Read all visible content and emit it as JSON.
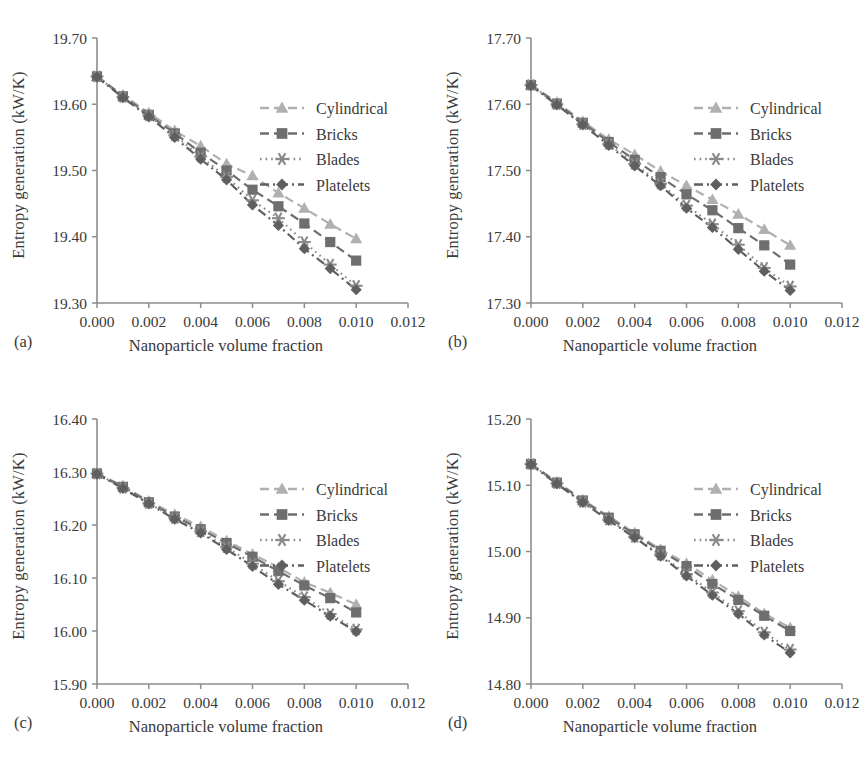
{
  "figure": {
    "panels": [
      "a",
      "b",
      "c",
      "d"
    ],
    "panel_tags": {
      "a": "(a)",
      "b": "(b)",
      "c": "(c)",
      "d": "(d)"
    },
    "axis_label_x": "Nanoparticle volume fraction",
    "axis_label_y": "Entropy generation (kW/K)",
    "colors": {
      "cylindrical": "#b0b0b0",
      "bricks": "#6e6e6e",
      "blades": "#8a8a8a",
      "platelets": "#5f5f5f",
      "axis": "#8d8d8d",
      "text": "#3a3a3a",
      "background": "#ffffff"
    }
  },
  "chart_data": [
    {
      "type": "line",
      "panel": "a",
      "title": "(a)",
      "xlabel": "Nanoparticle volume fraction",
      "ylabel": "Entropy generation (kW/K)",
      "xlim": [
        0.0,
        0.012
      ],
      "ylim": [
        19.3,
        19.7
      ],
      "xticks": [
        0.0,
        0.002,
        0.004,
        0.006,
        0.008,
        0.01,
        0.012
      ],
      "xticklabels": [
        "0.000",
        "0.002",
        "0.004",
        "0.006",
        "0.008",
        "0.010",
        "0.012"
      ],
      "yticks": [
        19.3,
        19.4,
        19.5,
        19.6,
        19.7
      ],
      "yticklabels": [
        "19.30",
        "19.40",
        "19.50",
        "19.60",
        "19.70"
      ],
      "grid": false,
      "legend_position": "upper right",
      "x": [
        0.0,
        0.001,
        0.002,
        0.003,
        0.004,
        0.005,
        0.006,
        0.007,
        0.008,
        0.009,
        0.01
      ],
      "series": [
        {
          "name": "Cylindrical",
          "marker": "triangle",
          "dash": "dashed",
          "values": [
            19.642,
            19.614,
            19.587,
            19.56,
            19.537,
            19.51,
            19.492,
            19.466,
            19.443,
            19.419,
            19.397
          ]
        },
        {
          "name": "Bricks",
          "marker": "square",
          "dash": "dashed",
          "values": [
            19.642,
            19.612,
            19.584,
            19.556,
            19.527,
            19.5,
            19.471,
            19.446,
            19.42,
            19.392,
            19.364
          ]
        },
        {
          "name": "Blades",
          "marker": "asterisk",
          "dash": "dotted",
          "values": [
            19.642,
            19.611,
            19.583,
            19.553,
            19.521,
            19.49,
            19.455,
            19.428,
            19.392,
            19.358,
            19.326
          ]
        },
        {
          "name": "Platelets",
          "marker": "diamond",
          "dash": "dashdot",
          "values": [
            19.641,
            19.61,
            19.581,
            19.55,
            19.517,
            19.486,
            19.448,
            19.417,
            19.382,
            19.352,
            19.32
          ]
        }
      ]
    },
    {
      "type": "line",
      "panel": "b",
      "title": "(b)",
      "xlabel": "Nanoparticle volume fraction",
      "ylabel": "Entropy generation (kW/K)",
      "xlim": [
        0.0,
        0.012
      ],
      "ylim": [
        17.3,
        17.7
      ],
      "xticks": [
        0.0,
        0.002,
        0.004,
        0.006,
        0.008,
        0.01,
        0.012
      ],
      "xticklabels": [
        "0.000",
        "0.002",
        "0.004",
        "0.006",
        "0.008",
        "0.010",
        "0.012"
      ],
      "yticks": [
        17.3,
        17.4,
        17.5,
        17.6,
        17.7
      ],
      "yticklabels": [
        "17.30",
        "17.40",
        "17.50",
        "17.60",
        "17.70"
      ],
      "grid": false,
      "legend_position": "upper right",
      "x": [
        0.0,
        0.001,
        0.002,
        0.003,
        0.004,
        0.005,
        0.006,
        0.007,
        0.008,
        0.009,
        0.01
      ],
      "series": [
        {
          "name": "Cylindrical",
          "marker": "triangle",
          "dash": "dashed",
          "values": [
            17.629,
            17.603,
            17.574,
            17.547,
            17.524,
            17.499,
            17.477,
            17.456,
            17.434,
            17.411,
            17.387
          ]
        },
        {
          "name": "Bricks",
          "marker": "square",
          "dash": "dashed",
          "values": [
            17.629,
            17.601,
            17.572,
            17.543,
            17.516,
            17.49,
            17.464,
            17.44,
            17.413,
            17.387,
            17.358
          ]
        },
        {
          "name": "Blades",
          "marker": "asterisk",
          "dash": "dotted",
          "values": [
            17.629,
            17.6,
            17.57,
            17.54,
            17.51,
            17.48,
            17.447,
            17.419,
            17.388,
            17.353,
            17.325
          ]
        },
        {
          "name": "Platelets",
          "marker": "diamond",
          "dash": "dashdot",
          "values": [
            17.628,
            17.599,
            17.569,
            17.538,
            17.507,
            17.477,
            17.443,
            17.414,
            17.381,
            17.348,
            17.319
          ]
        }
      ]
    },
    {
      "type": "line",
      "panel": "c",
      "title": "(c)",
      "xlabel": "Nanoparticle volume fraction",
      "ylabel": "Entropy generation (kW/K)",
      "xlim": [
        0.0,
        0.012
      ],
      "ylim": [
        15.9,
        16.4
      ],
      "xticks": [
        0.0,
        0.002,
        0.004,
        0.006,
        0.008,
        0.01,
        0.012
      ],
      "xticklabels": [
        "0.000",
        "0.002",
        "0.004",
        "0.006",
        "0.008",
        "0.010",
        "0.012"
      ],
      "yticks": [
        15.9,
        16.0,
        16.1,
        16.2,
        16.3,
        16.4
      ],
      "yticklabels": [
        "15.90",
        "16.00",
        "16.10",
        "16.20",
        "16.30",
        "16.40"
      ],
      "grid": false,
      "legend_position": "upper right",
      "x": [
        0.0,
        0.001,
        0.002,
        0.003,
        0.004,
        0.005,
        0.006,
        0.007,
        0.008,
        0.009,
        0.01
      ],
      "series": [
        {
          "name": "Cylindrical",
          "marker": "triangle",
          "dash": "dashed",
          "values": [
            16.297,
            16.274,
            16.245,
            16.22,
            16.197,
            16.17,
            16.145,
            16.12,
            16.092,
            16.072,
            16.05
          ]
        },
        {
          "name": "Bricks",
          "marker": "square",
          "dash": "dashed",
          "values": [
            16.297,
            16.272,
            16.243,
            16.216,
            16.192,
            16.166,
            16.14,
            16.113,
            16.086,
            16.062,
            16.035
          ]
        },
        {
          "name": "Blades",
          "marker": "asterisk",
          "dash": "dotted",
          "values": [
            16.297,
            16.27,
            16.241,
            16.213,
            16.188,
            16.158,
            16.127,
            16.094,
            16.064,
            16.032,
            16.003
          ]
        },
        {
          "name": "Platelets",
          "marker": "diamond",
          "dash": "dashdot",
          "values": [
            16.296,
            16.269,
            16.24,
            16.211,
            16.185,
            16.154,
            16.122,
            16.088,
            16.058,
            16.028,
            15.999
          ]
        }
      ]
    },
    {
      "type": "line",
      "panel": "d",
      "title": "(d)",
      "xlabel": "Nanoparticle volume fraction",
      "ylabel": "Entropy generation (kW/K)",
      "xlim": [
        0.0,
        0.012
      ],
      "ylim": [
        14.8,
        15.2
      ],
      "xticks": [
        0.0,
        0.002,
        0.004,
        0.006,
        0.008,
        0.01,
        0.012
      ],
      "xticklabels": [
        "0.000",
        "0.002",
        "0.004",
        "0.006",
        "0.008",
        "0.010",
        "0.012"
      ],
      "yticks": [
        14.8,
        14.9,
        15.0,
        15.1,
        15.2
      ],
      "yticklabels": [
        "14.80",
        "14.90",
        "15.00",
        "15.10",
        "15.20"
      ],
      "grid": false,
      "legend_position": "upper right",
      "x": [
        0.0,
        0.001,
        0.002,
        0.003,
        0.004,
        0.005,
        0.006,
        0.007,
        0.008,
        0.009,
        0.01
      ],
      "series": [
        {
          "name": "Cylindrical",
          "marker": "triangle",
          "dash": "dashed",
          "values": [
            15.132,
            15.105,
            15.078,
            15.053,
            15.028,
            15.003,
            14.982,
            14.957,
            14.932,
            14.906,
            14.885
          ]
        },
        {
          "name": "Bricks",
          "marker": "square",
          "dash": "dashed",
          "values": [
            15.132,
            15.104,
            15.077,
            15.051,
            15.026,
            15.001,
            14.978,
            14.951,
            14.927,
            14.903,
            14.88
          ]
        },
        {
          "name": "Blades",
          "marker": "asterisk",
          "dash": "dotted",
          "values": [
            15.132,
            15.103,
            15.075,
            15.048,
            15.022,
            14.995,
            14.966,
            14.938,
            14.91,
            14.878,
            14.852
          ]
        },
        {
          "name": "Platelets",
          "marker": "diamond",
          "dash": "dashdot",
          "values": [
            15.131,
            15.102,
            15.074,
            15.047,
            15.021,
            14.993,
            14.963,
            14.934,
            14.906,
            14.874,
            14.847
          ]
        }
      ]
    }
  ],
  "legend": {
    "entries": [
      {
        "label": "Cylindrical",
        "marker": "triangle",
        "dash": "dashed",
        "color": "#b0b0b0"
      },
      {
        "label": "Bricks",
        "marker": "square",
        "dash": "dashed",
        "color": "#6e6e6e"
      },
      {
        "label": "Blades",
        "marker": "asterisk",
        "dash": "dotted",
        "color": "#8a8a8a"
      },
      {
        "label": "Platelets",
        "marker": "diamond",
        "dash": "dashdot",
        "color": "#5f5f5f"
      }
    ]
  }
}
